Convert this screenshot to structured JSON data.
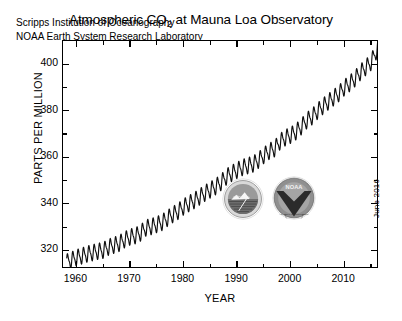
{
  "chart_data": {
    "type": "line",
    "title": "Atmospheric CO2 at Mauna Loa Observatory",
    "title_prefix": "Atmospheric CO",
    "title_subscript": "2",
    "title_suffix": " at Mauna Loa Observatory",
    "xlabel": "YEAR",
    "ylabel": "PARTS PER MILLION",
    "xlim": [
      1957.5,
      2016.5
    ],
    "ylim": [
      312,
      410
    ],
    "xticks": [
      1960,
      1970,
      1980,
      1990,
      2000,
      2010
    ],
    "xticklabels": [
      "1960",
      "1970",
      "1980",
      "1990",
      "2000",
      "2010"
    ],
    "xminorticks": [
      1965,
      1975,
      1985,
      1995,
      2005,
      2015
    ],
    "yticks": [
      320,
      340,
      360,
      380,
      400
    ],
    "yticklabels": [
      "320",
      "340",
      "360",
      "380",
      "400"
    ],
    "yminorticks": [
      330,
      350,
      370,
      390
    ],
    "grid": false,
    "legend": null,
    "series_name": "Monthly mean CO2 concentration",
    "annotations": [
      "Scripps Institution of Oceanography",
      "NOAA Earth System Research Laboratory"
    ],
    "date_stamp": "June 2016",
    "seasonal_amplitude": 3.0,
    "x": [
      1958.2,
      1959,
      1960,
      1961,
      1962,
      1963,
      1964,
      1965,
      1966,
      1967,
      1968,
      1969,
      1970,
      1971,
      1972,
      1973,
      1974,
      1975,
      1976,
      1977,
      1978,
      1979,
      1980,
      1981,
      1982,
      1983,
      1984,
      1985,
      1986,
      1987,
      1988,
      1989,
      1990,
      1991,
      1992,
      1993,
      1994,
      1995,
      1996,
      1997,
      1998,
      1999,
      2000,
      2001,
      2002,
      2003,
      2004,
      2005,
      2006,
      2007,
      2008,
      2009,
      2010,
      2011,
      2012,
      2013,
      2014,
      2015,
      2016.4
    ],
    "y": [
      315.0,
      315.8,
      316.9,
      317.6,
      318.4,
      319.0,
      319.6,
      320.0,
      321.4,
      322.2,
      323.0,
      324.6,
      325.7,
      326.3,
      327.5,
      329.7,
      330.2,
      331.1,
      332.0,
      333.8,
      335.4,
      336.8,
      338.7,
      340.1,
      341.4,
      343.0,
      344.6,
      346.0,
      347.4,
      349.2,
      351.6,
      353.1,
      354.4,
      355.6,
      356.4,
      357.1,
      358.8,
      360.8,
      362.6,
      363.7,
      366.7,
      368.4,
      369.5,
      371.0,
      373.2,
      375.8,
      377.5,
      379.8,
      381.9,
      383.8,
      385.6,
      387.4,
      389.9,
      391.7,
      393.8,
      396.5,
      398.6,
      400.8,
      407.5
    ]
  },
  "logos": {
    "scripps": {
      "name": "Scripps Institution of Oceanography",
      "icon": "scripps-seal-icon"
    },
    "noaa": {
      "name": "NOAA",
      "label": "NOAA",
      "ring_text": "U.S. DEPARTMENT OF COMMERCE",
      "icon": "noaa-seal-icon"
    }
  },
  "colors": {
    "background": "#ffffff",
    "axis": "#000000",
    "curve": "#101010",
    "logo_grey": "#8c8c8c",
    "logo_dark": "#2b2b2b"
  }
}
